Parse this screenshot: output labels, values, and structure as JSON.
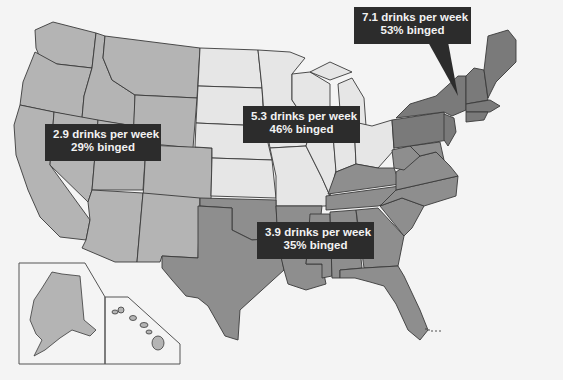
{
  "map": {
    "type": "choropleth",
    "subject": "Alcohol consumption by US region",
    "colors": {
      "background": "#f4f4f4",
      "west": "#b4b4b4",
      "midwest": "#e6e6e6",
      "south": "#8e8e8e",
      "northeast": "#7a7a7a",
      "callout_bg": "#2c2c2c",
      "callout_text": "#f2f2f2",
      "border": "#3a3a3a"
    },
    "regions": [
      {
        "id": "west",
        "drinks_line": "2.9 drinks per week",
        "binged_line": "29% binged",
        "drinks_per_week": 2.9,
        "binged_percent": 29
      },
      {
        "id": "midwest",
        "drinks_line": "5.3 drinks per week",
        "binged_line": "46% binged",
        "drinks_per_week": 5.3,
        "binged_percent": 46
      },
      {
        "id": "south",
        "drinks_line": "3.9 drinks per week",
        "binged_line": "35% binged",
        "drinks_per_week": 3.9,
        "binged_percent": 35
      },
      {
        "id": "northeast",
        "drinks_line": "7.1 drinks per week",
        "binged_line": "53% binged",
        "drinks_per_week": 7.1,
        "binged_percent": 53
      }
    ],
    "insets": [
      "Alaska",
      "Hawaii"
    ]
  }
}
